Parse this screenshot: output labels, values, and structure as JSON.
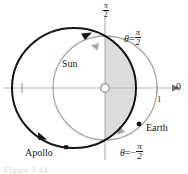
{
  "figure": {
    "type": "polar-orbit-diagram",
    "caption": "Figure 9.44",
    "labels": {
      "sun": "Sun",
      "apollo": "Apollo",
      "earth": "Earth",
      "polar_axis": "0",
      "radial_tick": "1",
      "vertical_axis": {
        "numerator": "π",
        "denominator": "2"
      },
      "theta_positive": {
        "variable": "θ",
        "equals": "=",
        "numerator": "π",
        "denominator": "2"
      },
      "theta_negative": {
        "variable": "θ",
        "equals": "=",
        "sign": "−",
        "numerator": "π",
        "denominator": "2"
      }
    },
    "colors": {
      "apollo_orbit": "#151515",
      "earth_orbit": "#a8a8a8",
      "axis": "#b4b4b4",
      "shaded_region": "#dcdcdc",
      "marker": "#151515",
      "background": "#ffffff",
      "caption": "#d8d8d8"
    },
    "geometry": {
      "origin": {
        "x": 105,
        "y": 88
      },
      "sun_marker_radius": 4,
      "apollo_orbit": {
        "cx": 74,
        "cy": 88,
        "rx": 62,
        "ry": 60
      },
      "earth_orbit": {
        "cx": 105,
        "cy": 88,
        "rx": 52,
        "ry": 52
      },
      "polar_axis_arrow_x": 174,
      "radial_tick_x": 157,
      "left_tick_x": 22
    },
    "markers": [
      {
        "name": "sun",
        "x": 105,
        "y": 88,
        "style": "open-circle"
      },
      {
        "name": "earth",
        "x": 138,
        "y": 124,
        "style": "filled-dot"
      },
      {
        "name": "apollo",
        "x": 66,
        "y": 147,
        "style": "filled-square"
      }
    ],
    "direction_arrows": [
      {
        "curve": "apollo_orbit",
        "x": 88,
        "y": 36,
        "direction": "counterclockwise"
      },
      {
        "curve": "apollo_orbit",
        "x": 44,
        "y": 136,
        "direction": "counterclockwise"
      },
      {
        "curve": "earth_orbit",
        "x": 95,
        "y": 46,
        "direction": "counterclockwise"
      },
      {
        "curve": "earth_orbit",
        "x": 123,
        "y": 132,
        "direction": "counterclockwise"
      }
    ]
  }
}
